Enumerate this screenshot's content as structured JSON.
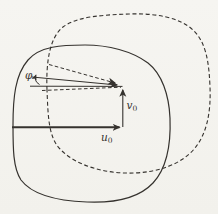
{
  "figure": {
    "colors": {
      "ink": "#35322e",
      "background": "#f6f5f1"
    },
    "labels": {
      "angle_phi": "φ",
      "v0_base": "v",
      "v0_sub": "0",
      "u0_base": "u",
      "u0_sub": "0"
    }
  }
}
